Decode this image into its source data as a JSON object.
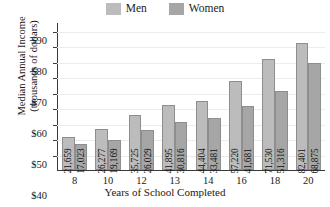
{
  "chart_data": {
    "type": "bar",
    "title": "",
    "xlabel": "Years of School Completed",
    "ylabel_line1": "Median Annual Income",
    "ylabel_line2": "(thousands of dollars)",
    "categories": [
      "8",
      "10",
      "12",
      "13",
      "14",
      "16",
      "18",
      "20"
    ],
    "series": [
      {
        "name": "Men",
        "color": "#bcbcbc",
        "values": [
          21659,
          26277,
          35725,
          41895,
          44404,
          57220,
          71530,
          82401
        ],
        "labels": [
          "21,659",
          "26,277",
          "35,725",
          "41,895",
          "44,404",
          "57,220",
          "71,530",
          "82,401"
        ]
      },
      {
        "name": "Women",
        "color": "#a6a6a6",
        "values": [
          17023,
          19169,
          26029,
          30816,
          33481,
          41681,
          51316,
          68875
        ],
        "labels": [
          "17,023",
          "19,169",
          "26,029",
          "30,816",
          "33,481",
          "41,681",
          "51,316",
          "68,875"
        ]
      }
    ],
    "ylim": [
      0,
      95000
    ],
    "yticks": [
      10000,
      20000,
      30000,
      40000,
      50000,
      60000,
      70000,
      80000,
      90000
    ],
    "ytick_labels": [
      "$10",
      "$20",
      "$30",
      "$40",
      "$50",
      "$60",
      "$70",
      "$80",
      "$90"
    ],
    "grid": true,
    "legend_position": "top-center"
  },
  "legend": {
    "entries": [
      {
        "label": "Men",
        "color": "#bcbcbc"
      },
      {
        "label": "Women",
        "color": "#a6a6a6"
      }
    ]
  },
  "axes": {
    "x_title": "Years of School Completed",
    "y_title_line1": "Median Annual Income",
    "y_title_line2": "(thousands of dollars)"
  }
}
